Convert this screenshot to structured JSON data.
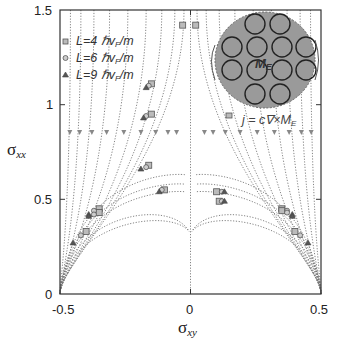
{
  "chart_data": {
    "type": "line",
    "title": "",
    "xlabel": "σxy",
    "ylabel": "σxx",
    "xlim": [
      -0.5,
      0.5
    ],
    "ylim": [
      0,
      1.5
    ],
    "xticks": [
      "-0.5",
      "0",
      "0.5"
    ],
    "yticks": [
      "0",
      "0.5",
      "1",
      "1.5"
    ],
    "grid": false,
    "legend_position": "upper-left",
    "legend": [
      {
        "marker": "square",
        "label": "L=4 ℏvF/m"
      },
      {
        "marker": "circle",
        "label": "L=6 ℏvF/m"
      },
      {
        "marker": "triangle",
        "label": "L=9 ℏvF/m"
      }
    ],
    "series_description": "Dotted flow lines (RG flow) from top converging to (-0.5,0) and (0.5,0); semicircular flow lines in lower region; markers along flows for three system sizes L",
    "markers": {
      "L4": [
        [
          -0.15,
          1.11
        ],
        [
          -0.15,
          0.95
        ],
        [
          -0.16,
          0.68
        ],
        [
          -0.1,
          0.55
        ],
        [
          -0.35,
          0.45
        ],
        [
          -0.35,
          0.43
        ],
        [
          -0.4,
          0.33
        ],
        [
          0.1,
          0.54
        ],
        [
          0.11,
          0.49
        ],
        [
          0.35,
          0.45
        ],
        [
          0.35,
          0.44
        ],
        [
          0.4,
          0.33
        ],
        [
          -0.03,
          1.42
        ],
        [
          0.02,
          1.42
        ]
      ],
      "L6": [
        [
          -0.16,
          1.1
        ],
        [
          -0.17,
          0.94
        ],
        [
          -0.17,
          0.67
        ],
        [
          -0.11,
          0.55
        ],
        [
          -0.37,
          0.44
        ],
        [
          -0.37,
          0.42
        ],
        [
          -0.42,
          0.31
        ],
        [
          0.12,
          0.54
        ],
        [
          0.12,
          0.49
        ],
        [
          0.37,
          0.44
        ],
        [
          0.37,
          0.43
        ],
        [
          0.42,
          0.31
        ]
      ],
      "L9": [
        [
          -0.17,
          1.09
        ],
        [
          -0.18,
          0.93
        ],
        [
          -0.19,
          0.66
        ],
        [
          -0.12,
          0.54
        ],
        [
          -0.39,
          0.42
        ],
        [
          -0.39,
          0.41
        ],
        [
          -0.45,
          0.27
        ],
        [
          0.13,
          0.54
        ],
        [
          0.13,
          0.49
        ],
        [
          0.39,
          0.42
        ],
        [
          0.39,
          0.41
        ],
        [
          0.45,
          0.27
        ]
      ]
    },
    "annotations": [
      {
        "text": "ME",
        "location": "inset circle center"
      },
      {
        "text": "j = c∇×ME",
        "location": "below inset"
      }
    ]
  },
  "axes": {
    "x_label_main": "σ",
    "x_label_sub": "xy",
    "y_label_main": "σ",
    "y_label_sub": "xx",
    "x_ticks": [
      "-0.5",
      "0",
      "0.5"
    ],
    "y_ticks": [
      "0",
      "0.5",
      "1",
      "1.5"
    ]
  },
  "legend": {
    "items": [
      "L=4 ℏv",
      "L=6 ℏv",
      "L=9 ℏv"
    ],
    "sub": "F",
    "suffix": "/m"
  },
  "inset": {
    "label_main": "M",
    "label_sub": "E",
    "equation_prefix": "j = c∇×M",
    "equation_sub": "E"
  }
}
